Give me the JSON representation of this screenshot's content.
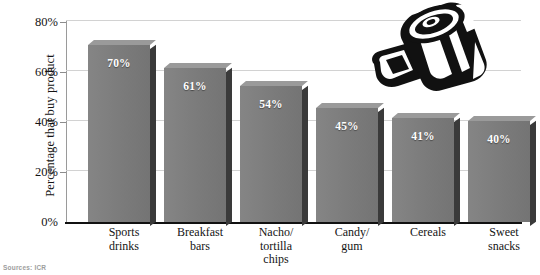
{
  "chart_data": {
    "type": "bar",
    "title": "",
    "subtitle": "",
    "xlabel": "",
    "ylabel": "Percentage that buy product",
    "categories": [
      "Sports drinks",
      "Breakfast bars",
      "Nacho/ tortilla chips",
      "Candy/ gum",
      "Cereals",
      "Sweet snacks"
    ],
    "category_lines": [
      [
        "Sports",
        "drinks"
      ],
      [
        "Breakfast",
        "bars"
      ],
      [
        "Nacho/",
        "tortilla",
        "chips"
      ],
      [
        "Candy/",
        "gum"
      ],
      [
        "Cereals"
      ],
      [
        "Sweet",
        "snacks"
      ]
    ],
    "values": [
      70,
      61,
      54,
      45,
      41,
      40
    ],
    "data_labels": [
      "70%",
      "61%",
      "54%",
      "45%",
      "41%",
      "40%"
    ],
    "ylim": [
      0,
      80
    ],
    "yticks": [
      0,
      20,
      40,
      60,
      80
    ],
    "ytick_labels": [
      "0%",
      "20%",
      "40%",
      "60%",
      "80%"
    ],
    "grid": true,
    "grid_axis": "y",
    "legend": false,
    "bar_color": "#7d7d7d",
    "bar_shadow_color": "#3a3a3a",
    "grid_color": "#d2d2d2",
    "axis_color": "#111111",
    "label_text_color": "#ffffff"
  },
  "source": {
    "text": "Sources: ICR"
  },
  "illustration": {
    "name": "soda-can-and-chip-bag-illustration",
    "alt": "Black and white drawing of a striped beverage can with a snack bag"
  }
}
